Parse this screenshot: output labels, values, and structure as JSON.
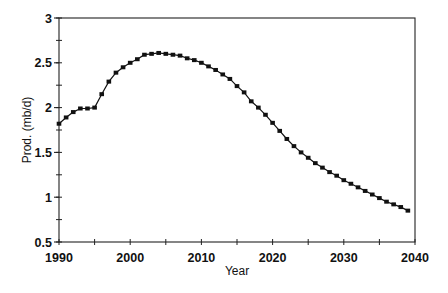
{
  "chart_data": {
    "type": "line",
    "title": "",
    "xlabel": "Year",
    "ylabel": "Prod. (mb/d)",
    "xlim": [
      1990,
      2040
    ],
    "ylim": [
      0.5,
      3
    ],
    "x_ticks": [
      1990,
      2000,
      2010,
      2020,
      2030,
      2040
    ],
    "x_tick_labels": [
      "1990",
      "2000",
      "2010",
      "2020",
      "2030",
      "2040"
    ],
    "x_minor_step": 5,
    "y_ticks": [
      0.5,
      1,
      1.5,
      2,
      2.5,
      3
    ],
    "y_tick_labels": [
      "0.5",
      "1",
      "1.5",
      "2",
      "2.5",
      "3"
    ],
    "y_minor_step": 0.25,
    "grid": false,
    "legend": null,
    "marker": "square",
    "line_color": "#111111",
    "series": [
      {
        "name": "Production",
        "x": [
          1990,
          1991,
          1992,
          1993,
          1994,
          1995,
          1996,
          1997,
          1998,
          1999,
          2000,
          2001,
          2002,
          2003,
          2004,
          2005,
          2006,
          2007,
          2008,
          2009,
          2010,
          2011,
          2012,
          2013,
          2014,
          2015,
          2016,
          2017,
          2018,
          2019,
          2020,
          2021,
          2022,
          2023,
          2024,
          2025,
          2026,
          2027,
          2028,
          2029,
          2030,
          2031,
          2032,
          2033,
          2034,
          2035,
          2036,
          2037,
          2038,
          2039
        ],
        "values": [
          1.82,
          1.89,
          1.95,
          1.99,
          1.99,
          2.0,
          2.15,
          2.29,
          2.39,
          2.45,
          2.5,
          2.54,
          2.59,
          2.6,
          2.61,
          2.6,
          2.59,
          2.58,
          2.55,
          2.53,
          2.5,
          2.46,
          2.42,
          2.37,
          2.32,
          2.24,
          2.17,
          2.07,
          2.0,
          1.92,
          1.83,
          1.74,
          1.65,
          1.57,
          1.5,
          1.44,
          1.38,
          1.33,
          1.28,
          1.24,
          1.19,
          1.15,
          1.11,
          1.07,
          1.03,
          0.99,
          0.95,
          0.92,
          0.89,
          0.85
        ]
      }
    ]
  }
}
